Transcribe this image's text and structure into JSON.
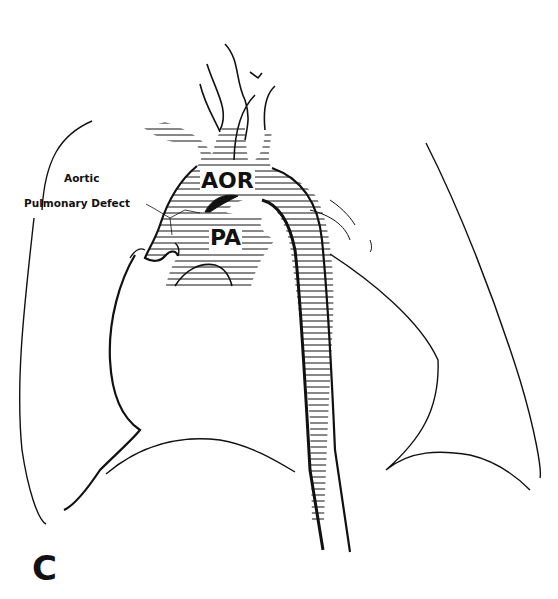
{
  "figure": {
    "panel_letter": "C",
    "labels": {
      "aorta": "AOR",
      "pulmonary_artery": "PA",
      "annotation_line1": "Aortic",
      "annotation_line2": "Pulmonary Defect"
    },
    "colors": {
      "ink": "#111111",
      "background": "#ffffff"
    }
  }
}
